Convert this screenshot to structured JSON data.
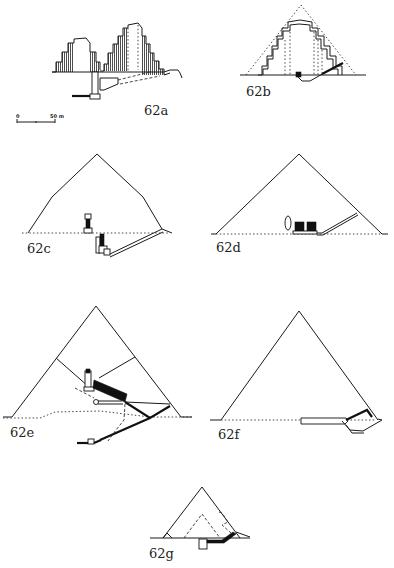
{
  "figure": {
    "panels": [
      {
        "id": "62a",
        "label": "62a",
        "subject": "step-pyramid-section"
      },
      {
        "id": "62b",
        "label": "62b",
        "subject": "layered-pyramid-section"
      },
      {
        "id": "62c",
        "label": "62c",
        "subject": "pyramid-section"
      },
      {
        "id": "62d",
        "label": "62d",
        "subject": "pyramid-section"
      },
      {
        "id": "62e",
        "label": "62e",
        "subject": "pyramid-section-with-chambers"
      },
      {
        "id": "62f",
        "label": "62f",
        "subject": "pyramid-section"
      },
      {
        "id": "62g",
        "label": "62g",
        "subject": "small-pyramid-section"
      }
    ],
    "scale_bar": {
      "start_label": "0",
      "end_label": "50 m"
    }
  }
}
